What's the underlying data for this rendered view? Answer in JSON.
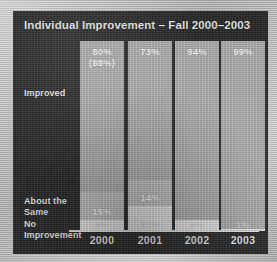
{
  "slide": {
    "title": "Individual Improvement – Fall 2000–2003",
    "background_color": "#2b2b2b",
    "frame_color": "#bfbfbf"
  },
  "row_labels": {
    "improved": "Improved",
    "about_the_same": "About the\nSame",
    "no_improvement": "No\nImprovement"
  },
  "axis": {
    "years": [
      "2000",
      "2001",
      "2002",
      "2003"
    ]
  },
  "bars": [
    {
      "year": "2000",
      "improved": "80%\n(88%)",
      "about_the_same": "15%",
      "no_improvement": "6%"
    },
    {
      "year": "2001",
      "improved": "73%",
      "about_the_same": "14%",
      "no_improvement": "13%"
    },
    {
      "year": "2002",
      "improved": "94%",
      "about_the_same": "",
      "no_improvement": "6%"
    },
    {
      "year": "2003",
      "improved": "99%",
      "about_the_same": "",
      "no_improvement": "1%"
    }
  ],
  "chart_data": {
    "type": "bar",
    "title": "Individual Improvement – Fall 2000–2003",
    "xlabel": "",
    "ylabel": "",
    "ylim": [
      0,
      100
    ],
    "grid": false,
    "legend_position": "left-row-labels",
    "stacked": true,
    "categories": [
      "2000",
      "2001",
      "2002",
      "2003"
    ],
    "series": [
      {
        "name": "Improved",
        "values": [
          80,
          73,
          94,
          99
        ],
        "color": "#b3b3b3",
        "labels": [
          "80% (88%)",
          "73%",
          "94%",
          "99%"
        ]
      },
      {
        "name": "About the Same",
        "values": [
          15,
          14,
          0,
          0
        ],
        "color": "#c6c6c6",
        "labels": [
          "15%",
          "14%",
          "",
          ""
        ]
      },
      {
        "name": "No Improvement",
        "values": [
          6,
          13,
          6,
          1
        ],
        "color": "#ececec",
        "labels": [
          "6%",
          "13%",
          "6%",
          "1%"
        ]
      }
    ],
    "annotations": [
      {
        "text": "(88%)",
        "category": "2000",
        "series": "Improved",
        "note": "secondary value shown in parentheses beneath 80%"
      }
    ]
  }
}
